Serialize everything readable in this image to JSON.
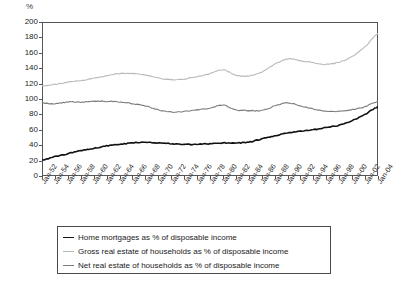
{
  "chart_data": {
    "type": "line",
    "title": "",
    "subtitle": "",
    "xlabel": "",
    "ylabel": "%",
    "ylim": [
      0,
      200
    ],
    "ytick_step": 20,
    "yticks": [
      0,
      20,
      40,
      60,
      80,
      100,
      120,
      140,
      160,
      180,
      200
    ],
    "grid": false,
    "legend_position": "bottom",
    "x_start_year": 1952,
    "x_end_year": 2004,
    "categories": [
      "Jan-52",
      "Jan-54",
      "Jan-56",
      "Jan-58",
      "Jan-60",
      "Jan-62",
      "Jan-64",
      "Jan-66",
      "Jan-68",
      "Jan-70",
      "Jan-72",
      "Jan-74",
      "Jan-76",
      "Jan-78",
      "Jan-80",
      "Jan-82",
      "Jan-84",
      "Jan-86",
      "Jan-88",
      "Jan-90",
      "Jan-92",
      "Jan-94",
      "Jan-96",
      "Jan-98",
      "Jan-00",
      "Jan-02",
      "Jan-04"
    ],
    "series": [
      {
        "name": "Home mortgages as % of disposable income",
        "color": "#111111",
        "width": 1.6,
        "values": [
          21,
          25,
          29,
          33,
          36,
          39,
          41,
          43,
          44,
          43,
          42,
          41,
          41,
          42,
          43,
          43,
          44,
          48,
          52,
          56,
          58,
          60,
          63,
          66,
          72,
          80,
          90
        ]
      },
      {
        "name": "Gross real estate of households as % of disposable income",
        "color": "#b9b9b9",
        "width": 1.1,
        "values": [
          117,
          119,
          122,
          124,
          127,
          130,
          133,
          133,
          131,
          127,
          125,
          126,
          129,
          133,
          138,
          131,
          130,
          135,
          145,
          152,
          150,
          147,
          145,
          148,
          155,
          168,
          185
        ]
      },
      {
        "name": "Net real estate of households as % of disposable income",
        "color": "#7c7c7c",
        "width": 1.1,
        "values": [
          95,
          94,
          96,
          96,
          97,
          97,
          96,
          94,
          91,
          86,
          83,
          84,
          86,
          88,
          92,
          86,
          85,
          85,
          91,
          95,
          91,
          87,
          84,
          84,
          86,
          90,
          97
        ]
      }
    ]
  },
  "legend": {
    "items": [
      {
        "label": "Home mortgages as % of disposable income",
        "color": "#111111"
      },
      {
        "label": "Gross real estate of households as % of disposable income",
        "color": "#b9b9b9"
      },
      {
        "label": "Net real estate of households as % of disposable income",
        "color": "#7c7c7c"
      }
    ]
  },
  "axis": {
    "unit_label": "%"
  }
}
